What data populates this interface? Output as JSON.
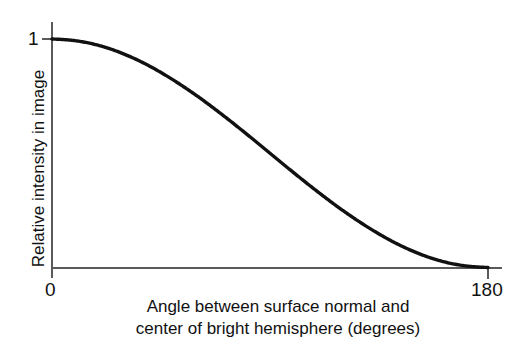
{
  "chart_data": {
    "type": "line",
    "title": "",
    "subtitle": "",
    "xlabel_line1": "Angle between surface normal and",
    "xlabel_line2": "center of bright hemisphere (degrees)",
    "ylabel": "Relative intensity in image",
    "xlim": [
      0,
      180
    ],
    "ylim": [
      0,
      1
    ],
    "xticks": [
      "0",
      "180"
    ],
    "xtick_values": [
      0,
      180
    ],
    "yticks": [
      "1"
    ],
    "ytick_values": [
      1
    ],
    "grid": false,
    "legend": false,
    "curve_color": "#111111",
    "axis_color": "#5a5a5a",
    "background": "#ffffff",
    "series": [
      {
        "name": "Relative intensity",
        "formula": "(1 + cos(theta)) / 2",
        "x": [
          0,
          10,
          20,
          30,
          40,
          50,
          60,
          70,
          80,
          90,
          100,
          110,
          120,
          130,
          140,
          150,
          160,
          170,
          180
        ],
        "values": [
          1.0,
          0.992,
          0.97,
          0.933,
          0.883,
          0.821,
          0.75,
          0.671,
          0.587,
          0.5,
          0.413,
          0.329,
          0.25,
          0.179,
          0.117,
          0.067,
          0.03,
          0.008,
          0.0
        ]
      }
    ]
  },
  "axes": {
    "y_tick_1": "1",
    "x_tick_0": "0",
    "x_tick_180": "180",
    "y_title": "Relative intensity in image",
    "x_title_line1": "Angle between surface normal and",
    "x_title_line2": "center of bright hemisphere (degrees)"
  }
}
